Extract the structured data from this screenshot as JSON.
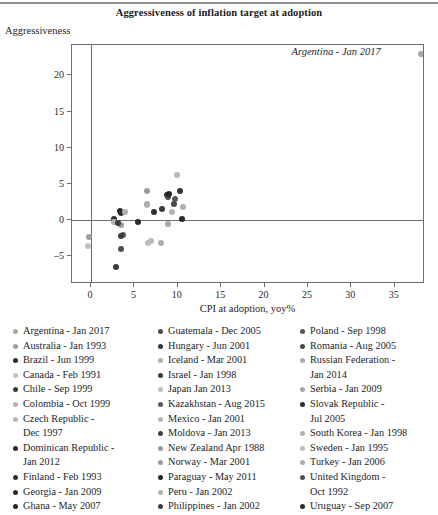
{
  "chart_data": {
    "type": "scatter",
    "title": "Aggressiveness of inflation target at adoption",
    "xlabel": "CPI at adoption, yoy%",
    "ylabel": "Aggressiveness",
    "xlim": [
      -2.2,
      38.5
    ],
    "ylim": [
      -8.8,
      24.2
    ],
    "xticks": [
      0,
      5,
      10,
      15,
      20,
      25,
      30,
      35
    ],
    "yticks": [
      -5,
      0,
      5,
      10,
      15,
      20
    ],
    "grid": false,
    "legend_position": "below",
    "annotations": [
      {
        "text": "Argentina - Jan 2017",
        "x": 34.2,
        "y": 22.9,
        "style": "italic"
      }
    ],
    "points": [
      {
        "label": "Argentina - Jan 2017",
        "x": 38.0,
        "y": 22.9,
        "color": "#a8a8a8"
      },
      {
        "label": "Australia - Jan 1993",
        "x": -0.2,
        "y": -2.3,
        "color": "#9e9e9e"
      },
      {
        "label": "Brazil - Jun 1999",
        "x": 3.5,
        "y": 1.0,
        "color": "#2f2f2f"
      },
      {
        "label": "Canada - Feb 1991",
        "x": 6.5,
        "y": 2.1,
        "color": "#c2c2c2"
      },
      {
        "label": "Chile - Sep 1999",
        "x": 2.9,
        "y": -6.5,
        "color": "#3a3a3a"
      },
      {
        "label": "Colombia - Oct 1999",
        "x": 9.3,
        "y": 1.2,
        "color": "#b4b4b4"
      },
      {
        "label": "Czech Republic - Dec 1997",
        "x": 9.9,
        "y": 6.2,
        "color": "#b8b8b8"
      },
      {
        "label": "Dominican Republic - Jan 2012",
        "x": 3.3,
        "y": 1.3,
        "color": "#2b2b2b"
      },
      {
        "label": "Finland - Feb 1993",
        "x": 2.6,
        "y": 0.2,
        "color": "#2f2f2f"
      },
      {
        "label": "Georgia - Jan 2009",
        "x": 8.8,
        "y": 3.5,
        "color": "#2c2c2c"
      },
      {
        "label": "Ghana - May 2007",
        "x": 10.5,
        "y": 0.2,
        "color": "#262626"
      },
      {
        "label": "Guatemala - Dec 2005",
        "x": 8.9,
        "y": 3.2,
        "color": "#4b4b4b"
      },
      {
        "label": "Hungary - Jun 2001",
        "x": 10.3,
        "y": 4.1,
        "color": "#333333"
      },
      {
        "label": "Iceland - Mar 2001",
        "x": 3.9,
        "y": 1.2,
        "color": "#b0b0b0"
      },
      {
        "label": "Israel - Jan 1998",
        "x": 8.2,
        "y": 1.5,
        "color": "#3b3b3b"
      },
      {
        "label": "Japan  Jan 2013",
        "x": -0.3,
        "y": -3.5,
        "color": "#c0c0c0"
      },
      {
        "label": "Kazakhstan - Aug 2015",
        "x": 3.7,
        "y": -2.1,
        "color": "#5a5a5a"
      },
      {
        "label": "Mexico - Jan 2001",
        "x": 6.9,
        "y": -2.9,
        "color": "#b8b8b8"
      },
      {
        "label": "Moldova - Jan 2013",
        "x": 3.5,
        "y": -2.2,
        "color": "#3f3f3f"
      },
      {
        "label": "New Zealand  Apr 1988",
        "x": 6.4,
        "y": 4.1,
        "color": "#9a9a9a"
      },
      {
        "label": "Norway - Mar 2001",
        "x": 3.5,
        "y": -0.6,
        "color": "#9c9c9c"
      },
      {
        "label": "Paraguay - May 2011",
        "x": 9.0,
        "y": 3.6,
        "color": "#242424"
      },
      {
        "label": "Peru - Jan 2002",
        "x": 2.7,
        "y": -0.3,
        "color": "#b2b2b2"
      },
      {
        "label": "Philippines - Jan 2002",
        "x": 3.1,
        "y": -0.4,
        "color": "#3d3d3d"
      },
      {
        "label": "Poland - Sep 1998",
        "x": 9.7,
        "y": 2.9,
        "color": "#555555"
      },
      {
        "label": "Romania - Aug 2005",
        "x": 9.6,
        "y": 2.3,
        "color": "#4a4a4a"
      },
      {
        "label": "Russian Federation - Jan 2014",
        "x": 6.5,
        "y": 2.3,
        "color": "#adadad"
      },
      {
        "label": "Serbia - Jan 2009",
        "x": 8.9,
        "y": -0.5,
        "color": "#a5a5a5"
      },
      {
        "label": "Slovak Republic - Jul 2005",
        "x": 7.3,
        "y": 1.1,
        "color": "#2e2e2e"
      },
      {
        "label": "South Korea - Jan 1998",
        "x": 10.6,
        "y": 1.8,
        "color": "#b0b0b0"
      },
      {
        "label": "Sweden - Jan 1995",
        "x": 6.6,
        "y": -3.1,
        "color": "#bcbcbc"
      },
      {
        "label": "Turkey - Jan 2006",
        "x": 8.1,
        "y": -3.2,
        "color": "#aeaeae"
      },
      {
        "label": "United Kingdom - Oct 1992",
        "x": 3.4,
        "y": -3.9,
        "color": "#4d4d4d"
      },
      {
        "label": "Uruguay - Sep 2007",
        "x": 5.4,
        "y": -0.2,
        "color": "#2b2b2b"
      }
    ]
  },
  "legend": {
    "columns": [
      {
        "items": [
          {
            "label": "Argentina - Jan 2017",
            "color": "#a8a8a8"
          },
          {
            "label": "Australia - Jan 1993",
            "color": "#9e9e9e"
          },
          {
            "label": "Brazil - Jun 1999",
            "color": "#2f2f2f"
          },
          {
            "label": "Canada - Feb 1991",
            "color": "#c2c2c2"
          },
          {
            "label": "Chile - Sep 1999",
            "color": "#3a3a3a"
          },
          {
            "label": "Colombia - Oct 1999",
            "color": "#b4b4b4"
          },
          {
            "label": "Czech Republic -\nDec 1997",
            "color": "#b8b8b8"
          },
          {
            "label": "Dominican Republic -\nJan 2012",
            "color": "#2b2b2b"
          },
          {
            "label": "Finland - Feb 1993",
            "color": "#2f2f2f"
          },
          {
            "label": "Georgia - Jan 2009",
            "color": "#2c2c2c"
          },
          {
            "label": "Ghana - May 2007",
            "color": "#262626"
          }
        ]
      },
      {
        "items": [
          {
            "label": "Guatemala - Dec 2005",
            "color": "#4b4b4b"
          },
          {
            "label": "Hungary - Jun 2001",
            "color": "#333333"
          },
          {
            "label": "Iceland - Mar 2001",
            "color": "#b0b0b0"
          },
          {
            "label": "Israel - Jan 1998",
            "color": "#3b3b3b"
          },
          {
            "label": "Japan  Jan 2013",
            "color": "#c0c0c0"
          },
          {
            "label": "Kazakhstan - Aug 2015",
            "color": "#5a5a5a"
          },
          {
            "label": "Mexico - Jan 2001",
            "color": "#b8b8b8"
          },
          {
            "label": "Moldova - Jan 2013",
            "color": "#3f3f3f"
          },
          {
            "label": "New Zealand  Apr 1988",
            "color": "#9a9a9a"
          },
          {
            "label": "Norway - Mar 2001",
            "color": "#9c9c9c"
          },
          {
            "label": "Paraguay - May 2011",
            "color": "#242424"
          },
          {
            "label": "Peru - Jan 2002",
            "color": "#b2b2b2"
          },
          {
            "label": "Philippines - Jan 2002",
            "color": "#3d3d3d"
          }
        ]
      },
      {
        "items": [
          {
            "label": "Poland - Sep 1998",
            "color": "#555555"
          },
          {
            "label": "Romania - Aug 2005",
            "color": "#4a4a4a"
          },
          {
            "label": "Russian Federation -\nJan 2014",
            "color": "#adadad"
          },
          {
            "label": "Serbia - Jan 2009",
            "color": "#a5a5a5"
          },
          {
            "label": "Slovak Republic -\nJul 2005",
            "color": "#2e2e2e"
          },
          {
            "label": "South Korea - Jan 1998",
            "color": "#b0b0b0"
          },
          {
            "label": "Sweden - Jan 1995",
            "color": "#bcbcbc"
          },
          {
            "label": "Turkey - Jan 2006",
            "color": "#aeaeae"
          },
          {
            "label": "United Kingdom -\nOct 1992",
            "color": "#4d4d4d"
          },
          {
            "label": "Uruguay - Sep 2007",
            "color": "#2b2b2b"
          }
        ]
      }
    ]
  }
}
